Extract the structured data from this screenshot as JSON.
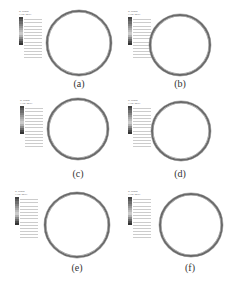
{
  "figure": {
    "panels": [
      {
        "id": "a",
        "label": "(a)",
        "legend_title": "S, Mises",
        "legend_subtitle": "(Avg: 75%)",
        "x": 0,
        "y": 0,
        "cx": 79,
        "cy": 43,
        "r": 33
      },
      {
        "id": "b",
        "label": "(b)",
        "legend_title": "S, Mises",
        "legend_subtitle": "(Avg: 75%)",
        "x": 117,
        "y": 0,
        "cx": 180,
        "cy": 45,
        "r": 31
      },
      {
        "id": "c",
        "label": "(c)",
        "legend_title": "S, Mises",
        "legend_subtitle": "(Avg: 75%)",
        "x": 0,
        "y": 95,
        "cx": 78,
        "cy": 129,
        "r": 31
      },
      {
        "id": "d",
        "label": "(d)",
        "legend_title": "S, Mises",
        "legend_subtitle": "(Avg: 75%)",
        "x": 117,
        "y": 95,
        "cx": 181,
        "cy": 131,
        "r": 30
      },
      {
        "id": "e",
        "label": "(e)",
        "legend_title": "S, Mises",
        "legend_subtitle": "(Avg: 75%)",
        "x": 0,
        "y": 185,
        "cx": 77,
        "cy": 225,
        "r": 33
      },
      {
        "id": "f",
        "label": "(f)",
        "legend_title": "S, Mises",
        "legend_subtitle": "(Avg: 75%)",
        "x": 117,
        "y": 185,
        "cx": 191,
        "cy": 225,
        "r": 32
      }
    ],
    "legend_colors": [
      "#444444",
      "#5a5a5a",
      "#6e6e6e",
      "#828282",
      "#969696",
      "#a8a8a8",
      "#bababa",
      "#cacaca",
      "#b0b0b0",
      "#8c8c8c",
      "#6a6a6a",
      "#4a4a4a",
      "#333333"
    ]
  }
}
